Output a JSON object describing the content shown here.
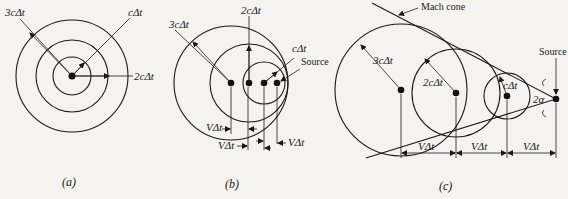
{
  "panels": [
    {
      "id": "a",
      "caption": "(a)",
      "description": "Stationary source: concentric wavefronts",
      "labels": {
        "r3": "3cΔt",
        "r1": "cΔt",
        "r2": "2cΔt"
      }
    },
    {
      "id": "b",
      "caption": "(b)",
      "description": "Subsonic moving source: nested, non-concentric wavefronts",
      "labels": {
        "r3": "3cΔt",
        "r2": "2cΔt",
        "r1": "cΔt",
        "source": "Source",
        "v1": "VΔt",
        "v2": "VΔt",
        "v3": "VΔt"
      }
    },
    {
      "id": "c",
      "caption": "(c)",
      "description": "Supersonic moving source: wavefronts bounded by Mach cone",
      "labels": {
        "mach": "Mach cone",
        "source": "Source",
        "r3": "3cΔt",
        "r2": "2cΔt",
        "r1": "cΔt",
        "angle": "2α",
        "v1": "VΔt",
        "v2": "VΔt",
        "v3": "VΔt"
      }
    }
  ]
}
